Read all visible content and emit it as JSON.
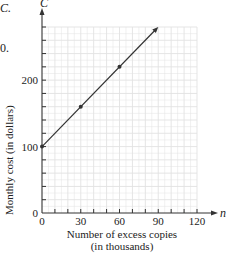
{
  "figure": {
    "corner_label": "C.",
    "corner_number": "0."
  },
  "chart_data": {
    "type": "line",
    "title": "",
    "xlabel": "Number of excess copies (in thousands)",
    "xlabel_line1": "Number of excess copies",
    "xlabel_line2": "(in thousands)",
    "ylabel": "Monthly cost (in dollars)",
    "x_axis_var": "n",
    "y_axis_var": "C",
    "xlim": [
      0,
      120
    ],
    "ylim": [
      0,
      280
    ],
    "x_ticks": [
      0,
      30,
      60,
      90,
      120
    ],
    "x_minor_step": 10,
    "y_ticks": [
      0,
      100,
      200
    ],
    "y_minor_step": 20,
    "grid": true,
    "series": [
      {
        "name": "Monthly cost",
        "x": [
          0,
          30,
          60,
          90
        ],
        "y": [
          100,
          160,
          220,
          280
        ],
        "marked_points": [
          [
            0,
            100
          ],
          [
            30,
            160
          ],
          [
            60,
            220
          ]
        ],
        "arrow_at_end": true,
        "color": "#333333"
      }
    ],
    "grid_color": "#e2e2e2",
    "axis_color": "#333333"
  }
}
